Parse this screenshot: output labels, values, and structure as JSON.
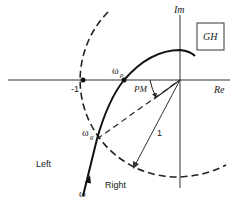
{
  "labels": {
    "im": "Im",
    "re": "Re",
    "gh": "GH",
    "minus_one": "-1",
    "omega_p": "ω",
    "omega_p_sub": "p",
    "omega_g": "ω",
    "omega_g_sub": "g",
    "omega": "ω",
    "pm": "PM",
    "radius": "1",
    "left": "Left",
    "right": "Right"
  }
}
